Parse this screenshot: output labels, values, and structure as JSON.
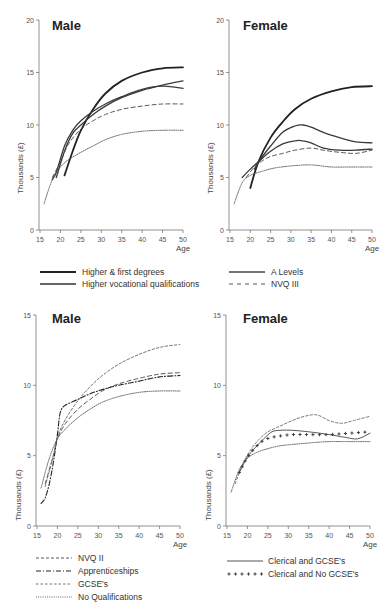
{
  "header": {
    "text": "Table 4.2"
  },
  "chart_data": [
    {
      "type": "line",
      "panel": "top-left",
      "title": "Male",
      "xlabel": "Age",
      "ylabel": "Thousands (£)",
      "xlim": [
        15,
        50
      ],
      "ylim": [
        0,
        20
      ],
      "xticks": [
        15,
        20,
        25,
        30,
        35,
        40,
        45,
        50
      ],
      "yticks": [
        0,
        5,
        10,
        15,
        20
      ],
      "series": [
        {
          "name": "Higher & first degrees",
          "style": "solid-thick",
          "x": [
            21,
            23,
            25,
            28,
            31,
            35,
            40,
            45,
            50
          ],
          "y": [
            5.2,
            7.5,
            9.5,
            11.5,
            13.0,
            14.2,
            15.0,
            15.4,
            15.5
          ]
        },
        {
          "name": "Higher vocational qualifications",
          "style": "solid",
          "x": [
            19,
            21,
            23,
            25,
            28,
            31,
            35,
            40,
            45,
            50
          ],
          "y": [
            5.0,
            7.5,
            9.2,
            10.0,
            11.0,
            11.8,
            12.6,
            13.3,
            13.8,
            14.2
          ]
        },
        {
          "name": "A Levels",
          "style": "solid",
          "x": [
            18,
            19,
            21,
            23,
            25,
            28,
            31,
            35,
            40,
            45,
            50
          ],
          "y": [
            4.8,
            5.5,
            8.0,
            9.5,
            10.4,
            11.3,
            12.0,
            12.7,
            13.4,
            13.7,
            13.5
          ]
        },
        {
          "name": "NVQ III",
          "style": "dashed",
          "x": [
            18,
            20,
            22,
            25,
            28,
            31,
            35,
            40,
            45,
            50
          ],
          "y": [
            5.0,
            6.5,
            8.2,
            9.6,
            10.4,
            11.0,
            11.5,
            11.8,
            12.0,
            12.0
          ]
        },
        {
          "name": "No Qualifications",
          "style": "dotted",
          "x": [
            16,
            18,
            20,
            22,
            25,
            28,
            31,
            35,
            40,
            45,
            50
          ],
          "y": [
            2.5,
            4.8,
            6.0,
            6.7,
            7.4,
            8.0,
            8.6,
            9.1,
            9.4,
            9.5,
            9.5
          ]
        }
      ]
    },
    {
      "type": "line",
      "panel": "top-right",
      "title": "Female",
      "xlabel": "Age",
      "ylabel": "Thousands (£)",
      "xlim": [
        15,
        50
      ],
      "ylim": [
        0,
        20
      ],
      "xticks": [
        15,
        20,
        25,
        30,
        35,
        40,
        45,
        50
      ],
      "yticks": [
        0,
        5,
        10,
        15,
        20
      ],
      "series": [
        {
          "name": "Higher & first degrees",
          "style": "solid-thick",
          "x": [
            20,
            22,
            25,
            28,
            31,
            35,
            40,
            45,
            50
          ],
          "y": [
            4.0,
            6.5,
            8.8,
            10.3,
            11.5,
            12.5,
            13.2,
            13.6,
            13.7
          ]
        },
        {
          "name": "Higher vocational qualifications",
          "style": "solid",
          "x": [
            21,
            23,
            25,
            28,
            31,
            33,
            35,
            38,
            42,
            46,
            50
          ],
          "y": [
            5.8,
            7.0,
            8.0,
            9.3,
            9.9,
            10.0,
            9.8,
            9.3,
            8.8,
            8.4,
            8.3
          ]
        },
        {
          "name": "A Levels",
          "style": "solid",
          "x": [
            18,
            20,
            22,
            25,
            28,
            31,
            33,
            35,
            38,
            42,
            46,
            50
          ],
          "y": [
            5.0,
            5.8,
            6.5,
            7.5,
            8.2,
            8.5,
            8.5,
            8.3,
            7.8,
            7.6,
            7.6,
            7.7
          ]
        },
        {
          "name": "NVQ III",
          "style": "dashed",
          "x": [
            19,
            21,
            23,
            25,
            28,
            31,
            35,
            38,
            42,
            46,
            50
          ],
          "y": [
            5.0,
            6.0,
            6.6,
            7.0,
            7.3,
            7.6,
            7.8,
            7.6,
            7.4,
            7.3,
            7.6
          ]
        },
        {
          "name": "No Qualifications",
          "style": "dotted",
          "x": [
            16,
            18,
            20,
            23,
            26,
            30,
            35,
            40,
            45,
            50
          ],
          "y": [
            2.5,
            4.5,
            5.2,
            5.6,
            5.9,
            6.1,
            6.2,
            6.0,
            6.0,
            6.0
          ]
        }
      ]
    },
    {
      "type": "line",
      "panel": "bottom-left",
      "title": "Male",
      "xlabel": "Age",
      "ylabel": "Thousands (£)",
      "xlim": [
        15,
        50
      ],
      "ylim": [
        0,
        15
      ],
      "xticks": [
        15,
        20,
        25,
        30,
        35,
        40,
        45,
        50
      ],
      "yticks": [
        0,
        5,
        10,
        15
      ],
      "series": [
        {
          "name": "NVQ II",
          "style": "dashed",
          "x": [
            17,
            19,
            20,
            22,
            25,
            28,
            31,
            35,
            40,
            45,
            50
          ],
          "y": [
            3.0,
            5.0,
            6.2,
            7.3,
            8.3,
            9.0,
            9.6,
            10.1,
            10.5,
            10.8,
            10.9
          ]
        },
        {
          "name": "Apprenticeships",
          "style": "dash-dot",
          "x": [
            16,
            17,
            18,
            19,
            20,
            20.5,
            21,
            22,
            25,
            28,
            31,
            35,
            40,
            45,
            50
          ],
          "y": [
            1.6,
            2.0,
            3.0,
            4.5,
            6.5,
            7.8,
            8.3,
            8.6,
            9.0,
            9.4,
            9.7,
            10.0,
            10.3,
            10.6,
            10.7
          ]
        },
        {
          "name": "GCSE's",
          "style": "dashed-fine",
          "x": [
            17,
            19,
            20,
            22,
            25,
            28,
            31,
            35,
            40,
            45,
            50
          ],
          "y": [
            2.8,
            5.0,
            6.3,
            7.6,
            8.9,
            9.9,
            10.7,
            11.5,
            12.2,
            12.7,
            12.9
          ]
        },
        {
          "name": "No Qualifications",
          "style": "dotted",
          "x": [
            16,
            18,
            20,
            22,
            25,
            28,
            31,
            35,
            40,
            45,
            50
          ],
          "y": [
            2.7,
            4.8,
            6.2,
            6.9,
            7.7,
            8.3,
            8.8,
            9.2,
            9.5,
            9.6,
            9.6
          ]
        }
      ]
    },
    {
      "type": "line",
      "panel": "bottom-right",
      "title": "Female",
      "xlabel": "Age",
      "ylabel": "Thousands (£)",
      "xlim": [
        15,
        50
      ],
      "ylim": [
        0,
        15
      ],
      "xticks": [
        15,
        20,
        25,
        30,
        35,
        40,
        45,
        50
      ],
      "yticks": [
        0,
        5,
        10,
        15
      ],
      "series": [
        {
          "name": "GCSE's",
          "style": "dashed-fine",
          "x": [
            17,
            19,
            21,
            23,
            25,
            28,
            31,
            34,
            37,
            40,
            43,
            46,
            50
          ],
          "y": [
            3.0,
            4.5,
            5.5,
            6.2,
            6.7,
            7.1,
            7.5,
            7.8,
            7.9,
            7.5,
            7.3,
            7.5,
            7.8
          ]
        },
        {
          "name": "Clerical and GCSE's",
          "style": "solid-thin",
          "x": [
            18,
            20,
            22,
            24,
            26,
            28,
            31,
            35,
            40,
            44,
            47,
            50
          ],
          "y": [
            3.8,
            4.9,
            5.6,
            6.2,
            6.7,
            6.8,
            6.8,
            6.7,
            6.5,
            6.3,
            6.2,
            6.6
          ]
        },
        {
          "name": "Clerical and No GCSE's",
          "style": "plus-markers",
          "x": [
            18,
            20,
            22,
            24,
            26,
            28,
            31,
            35,
            40,
            45,
            50
          ],
          "y": [
            3.8,
            4.9,
            5.6,
            6.1,
            6.3,
            6.4,
            6.5,
            6.5,
            6.5,
            6.6,
            6.7
          ]
        },
        {
          "name": "No Qualifications",
          "style": "dotted",
          "x": [
            16,
            18,
            20,
            22,
            25,
            28,
            31,
            35,
            40,
            45,
            50
          ],
          "y": [
            2.4,
            4.0,
            4.8,
            5.2,
            5.5,
            5.7,
            5.8,
            5.9,
            6.0,
            6.0,
            6.0
          ]
        }
      ]
    }
  ],
  "panels": {
    "tl": {
      "title": "Male",
      "ylabel": "Thousands (£)",
      "xlabel": "Age"
    },
    "tr": {
      "title": "Female",
      "ylabel": "Thousands (£)",
      "xlabel": "Age"
    },
    "bl": {
      "title": "Male",
      "ylabel": "Thousands (£)",
      "xlabel": "Age"
    },
    "br": {
      "title": "Female",
      "ylabel": "Thousands (£)",
      "xlabel": "Age"
    }
  },
  "legends": {
    "top": [
      {
        "label": "Higher & first degrees"
      },
      {
        "label": "Higher vocational qualifications"
      },
      {
        "label": "A Levels"
      },
      {
        "label": "NVQ III"
      }
    ],
    "bottom_left": [
      {
        "label": "NVQ II"
      },
      {
        "label": "Apprenticeships"
      },
      {
        "label": "GCSE's"
      },
      {
        "label": "No Qualifications"
      }
    ],
    "bottom_right": [
      {
        "label": "Clerical and GCSE's"
      },
      {
        "label": "Clerical and No GCSE's"
      }
    ]
  }
}
